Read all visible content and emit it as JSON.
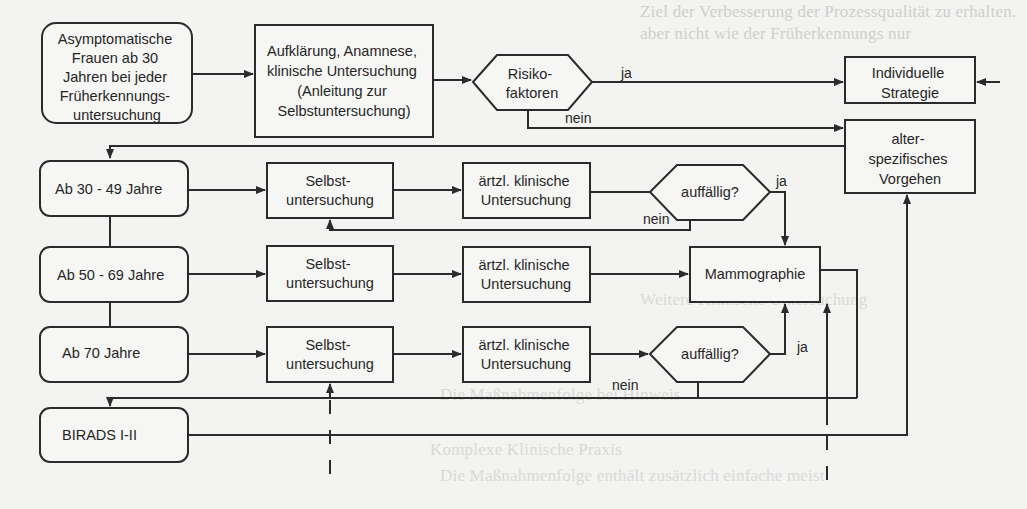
{
  "diagram": {
    "colors": {
      "stroke": "#2b2b2b",
      "background": "#f3f3f1",
      "box_fill": "#f6f6f4"
    },
    "nodes": {
      "start": {
        "lines": [
          "Asymptomatische",
          "Frauen ab 30",
          "Jahren bei jeder",
          "Früherkennungs-",
          "untersuchung"
        ]
      },
      "aufklaerung": {
        "lines": [
          "Aufklärung, Anamnese,",
          "klinische  Untersuchung",
          "(Anleitung zur",
          "Selbstuntersuchung)"
        ]
      },
      "risiko": {
        "lines": [
          "Risiko-",
          "faktoren"
        ]
      },
      "individuell": {
        "lines": [
          "Individuelle",
          "Strategie"
        ]
      },
      "altersspezifisch": {
        "lines": [
          "alter-",
          "spezifisches",
          "Vorgehen"
        ]
      },
      "age_30_49": {
        "lines": [
          "Ab 30 - 49 Jahre"
        ]
      },
      "age_50_69": {
        "lines": [
          "Ab 50 - 69 Jahre"
        ]
      },
      "age_70": {
        "lines": [
          "Ab 70 Jahre"
        ]
      },
      "birads": {
        "lines": [
          "BIRADS I-II"
        ]
      },
      "selbst_1": {
        "lines": [
          "Selbst-",
          "untersuchung"
        ]
      },
      "selbst_2": {
        "lines": [
          "Selbst-",
          "untersuchung"
        ]
      },
      "selbst_3": {
        "lines": [
          "Selbst-",
          "untersuchung"
        ]
      },
      "aerztl_1": {
        "lines": [
          "ärtzl. klinische",
          "Untersuchung"
        ]
      },
      "aerztl_2": {
        "lines": [
          "ärtzl. klinische",
          "Untersuchung"
        ]
      },
      "aerztl_3": {
        "lines": [
          "ärtzl. klinische",
          "Untersuchung"
        ]
      },
      "auffaellig_1": {
        "lines": [
          "auffällig?"
        ]
      },
      "auffaellig_3": {
        "lines": [
          "auffällig?"
        ]
      },
      "mammographie": {
        "lines": [
          "Mammographie"
        ]
      }
    },
    "edge_labels": {
      "risiko_ja": "ja",
      "risiko_nein": "nein",
      "auff1_ja": "ja",
      "auff1_nein": "nein",
      "auff3_ja": "ja",
      "auff3_nein": "nein"
    }
  }
}
